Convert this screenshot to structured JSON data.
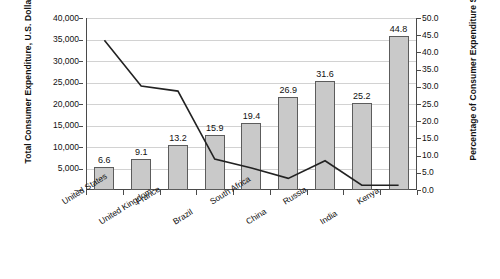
{
  "chart_data": {
    "type": "bar",
    "title": "",
    "subtitle": "",
    "categories": [
      "United States",
      "United Kingdom",
      "France",
      "Brazil",
      "South Africa",
      "China",
      "Russia",
      "India",
      "Kenya"
    ],
    "series": [
      {
        "name": "Percentage of Consumer Expenditure Spent on Food",
        "type": "bar",
        "axis": "right",
        "values": [
          6.6,
          9.1,
          13.2,
          15.9,
          19.4,
          26.9,
          31.6,
          25.2,
          44.8
        ],
        "labels": [
          "6.6",
          "9.1",
          "13.2",
          "15.9",
          "19.4",
          "26.9",
          "31.6",
          "25.2",
          "44.8"
        ]
      },
      {
        "name": "Total Consumer Expenditure, U.S. Dollars",
        "type": "line",
        "axis": "left",
        "values": [
          34800,
          24200,
          23000,
          7200,
          5100,
          2700,
          6800,
          1100,
          1100
        ]
      }
    ],
    "xlabel": "",
    "ylabel": "Total Consumer Expenditure, U.S. Dollars",
    "y2label": "Percentage of Consumer Expenditure Spent on Food",
    "ylim": [
      0,
      40000
    ],
    "y2lim": [
      0.0,
      50.0
    ],
    "yticks": [
      "–",
      "5,000",
      "10,000",
      "15,000",
      "20,000",
      "25,000",
      "30,000",
      "35,000",
      "40,000"
    ],
    "ytick_values": [
      0,
      5000,
      10000,
      15000,
      20000,
      25000,
      30000,
      35000,
      40000
    ],
    "y2ticks": [
      "0.0",
      "5.0",
      "10.0",
      "15.0",
      "20.0",
      "25.0",
      "30.0",
      "35.0",
      "40.0",
      "45.0",
      "50.0"
    ],
    "y2tick_values": [
      0,
      5,
      10,
      15,
      20,
      25,
      30,
      35,
      40,
      45,
      50
    ],
    "grid": true,
    "grid_axis": "y-left",
    "legend": "none",
    "colors": {
      "bar_fill": "#c9c9c9",
      "bar_stroke": "#5c5c5c",
      "line": "#222222",
      "gridline": "#d2d2d2",
      "axis": "#4a4a4a",
      "text": "#111111",
      "background": "#ffffff"
    }
  }
}
